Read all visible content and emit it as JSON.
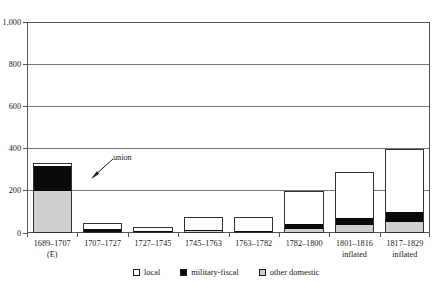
{
  "chart_data": {
    "type": "bar",
    "stacked": true,
    "title": "",
    "xlabel": "",
    "ylabel": "",
    "ylim": [
      0,
      1000
    ],
    "yticks": [
      0,
      200,
      400,
      600,
      800,
      1000
    ],
    "ytick_labels": [
      "0",
      "200",
      "400",
      "600",
      "800",
      "1,000"
    ],
    "grid": "horizontal",
    "legend_position": "bottom",
    "categories": [
      "1689–1707",
      "1707–1727",
      "1727–1745",
      "1745–1763",
      "1763–1782",
      "1782–1800",
      "1801–1816",
      "1817–1829"
    ],
    "category_sublabels": [
      "(E)",
      "",
      "",
      "",
      "",
      "",
      "inflated",
      "inflated"
    ],
    "series": [
      {
        "name": "other domestic",
        "color": "#cfcfcf",
        "values": [
          200,
          6,
          4,
          8,
          6,
          18,
          38,
          50
        ]
      },
      {
        "name": "military-fiscal",
        "color": "#0a0a0a",
        "values": [
          120,
          14,
          3,
          6,
          5,
          24,
          34,
          50
        ]
      },
      {
        "name": "local",
        "color": "#ffffff",
        "values": [
          13,
          28,
          17,
          62,
          63,
          158,
          218,
          300
        ]
      }
    ],
    "totals": [
      333,
      48,
      24,
      76,
      74,
      200,
      290,
      400
    ],
    "annotations": [
      {
        "text": "union",
        "target_category": "1707–1727"
      }
    ]
  },
  "legend": {
    "items": [
      {
        "label": "local",
        "swatch": "white-square-swatch"
      },
      {
        "label": "military-fiscal",
        "swatch": "black-square-swatch"
      },
      {
        "label": "other domestic",
        "swatch": "gray-square-swatch"
      }
    ]
  },
  "axis": {
    "y_labels": [
      "1,000",
      "800",
      "600",
      "400",
      "200",
      "0"
    ]
  }
}
